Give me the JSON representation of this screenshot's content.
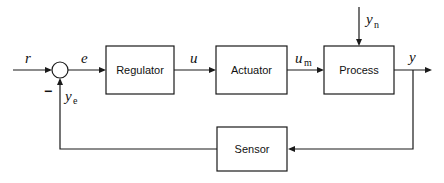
{
  "diagram": {
    "type": "feedback-control-block-diagram",
    "blocks": [
      {
        "id": "regulator",
        "label": "Regulator"
      },
      {
        "id": "actuator",
        "label": "Actuator"
      },
      {
        "id": "process",
        "label": "Process"
      },
      {
        "id": "sensor",
        "label": "Sensor"
      }
    ],
    "summing_junction": {
      "input_sign": "",
      "feedback_sign": "−"
    },
    "signals": {
      "reference": {
        "base": "r",
        "sub": ""
      },
      "error": {
        "base": "e",
        "sub": ""
      },
      "control": {
        "base": "u",
        "sub": ""
      },
      "manipulated": {
        "base": "u",
        "sub": "m"
      },
      "disturbance": {
        "base": "y",
        "sub": "n"
      },
      "output": {
        "base": "y",
        "sub": ""
      },
      "measured": {
        "base": "y",
        "sub": "e"
      }
    },
    "colors": {
      "stroke": "#1a1a1a",
      "background": "#ffffff"
    }
  }
}
